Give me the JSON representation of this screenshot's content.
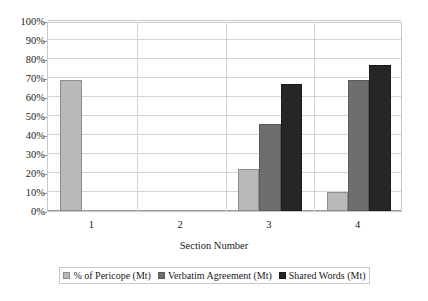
{
  "chart_data": {
    "type": "bar",
    "title": "",
    "xlabel": "Section Number",
    "ylabel": "",
    "categories": [
      "1",
      "2",
      "3",
      "4"
    ],
    "series": [
      {
        "name": "% of Pericope (Mt)",
        "color": "#b9b9b9",
        "values": [
          69,
          0,
          22,
          10
        ]
      },
      {
        "name": "Verbatim Agreement (Mt)",
        "color": "#6e6e6e",
        "values": [
          0,
          0,
          46,
          69
        ]
      },
      {
        "name": "Shared Words (Mt)",
        "color": "#262626",
        "values": [
          0,
          0,
          67,
          77
        ]
      }
    ],
    "ylim": [
      0,
      100
    ],
    "ytick_values": [
      0,
      10,
      20,
      30,
      40,
      50,
      60,
      70,
      80,
      90,
      100
    ],
    "ytick_labels": [
      "0%",
      "10%",
      "20%",
      "30%",
      "40%",
      "50%",
      "60%",
      "70%",
      "80%",
      "90%",
      "100%"
    ],
    "grid": true,
    "legend_position": "bottom"
  },
  "legend": {
    "items": [
      {
        "label": "% of Pericope (Mt)"
      },
      {
        "label": "Verbatim Agreement (Mt)"
      },
      {
        "label": "Shared Words (Mt)"
      }
    ]
  },
  "axes": {
    "x_title": "Section Number"
  },
  "page_bleed_text": ""
}
